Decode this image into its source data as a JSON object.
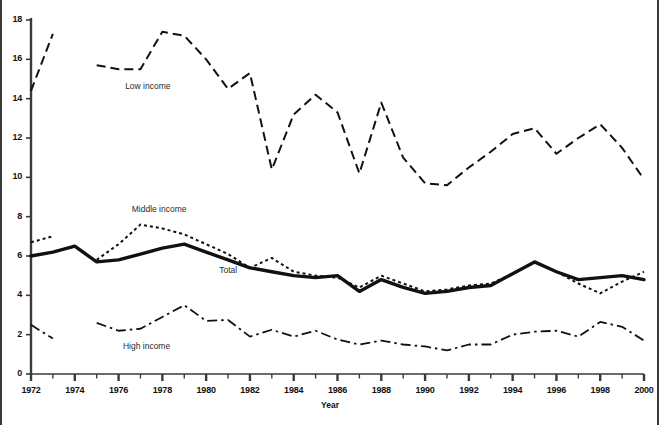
{
  "chart_data": {
    "type": "line",
    "title": "",
    "xlabel": "Year",
    "ylabel": "",
    "xlim": [
      1972,
      2000
    ],
    "ylim": [
      0,
      18
    ],
    "grid": false,
    "legend_position": "inline-annotations",
    "x": [
      1972,
      1973,
      1974,
      1975,
      1976,
      1977,
      1978,
      1979,
      1980,
      1981,
      1982,
      1983,
      1984,
      1985,
      1986,
      1987,
      1988,
      1989,
      1990,
      1991,
      1992,
      1993,
      1994,
      1995,
      1996,
      1997,
      1998,
      1999,
      2000
    ],
    "y_ticks": [
      0,
      2,
      4,
      6,
      8,
      10,
      12,
      14,
      16,
      18
    ],
    "y_tick_labels": [
      "0",
      "2",
      "4",
      "6",
      "8",
      "10",
      "12",
      "14",
      "16",
      "18"
    ],
    "x_ticks": [
      1972,
      1973,
      1974,
      1975,
      1976,
      1977,
      1978,
      1979,
      1980,
      1981,
      1982,
      1983,
      1984,
      1985,
      1986,
      1987,
      1988,
      1989,
      1990,
      1991,
      1992,
      1993,
      1994,
      1995,
      1996,
      1997,
      1998,
      1999,
      2000
    ],
    "x_tick_labels": [
      "1972",
      "1974",
      "1976",
      "1978",
      "1980",
      "1982",
      "1984",
      "1986",
      "1988",
      "1990",
      "1992",
      "1994",
      "1996",
      "1998",
      "2000"
    ],
    "x_labeled_ticks": [
      1972,
      1974,
      1976,
      1978,
      1980,
      1982,
      1984,
      1986,
      1988,
      1990,
      1992,
      1994,
      1996,
      1998,
      2000
    ],
    "series": [
      {
        "name": "Low income",
        "style": "dashed",
        "values": [
          14.4,
          17.3,
          null,
          15.7,
          15.5,
          15.5,
          17.4,
          17.2,
          16.0,
          14.5,
          15.3,
          10.4,
          13.2,
          14.2,
          13.3,
          10.2,
          13.8,
          11.0,
          9.7,
          9.6,
          10.5,
          11.3,
          12.2,
          12.5,
          11.2,
          12.0,
          12.7,
          11.5,
          9.9
        ]
      },
      {
        "name": "Middle income",
        "style": "dotted",
        "values": [
          6.7,
          7.0,
          null,
          5.8,
          6.6,
          7.6,
          7.4,
          7.1,
          6.6,
          6.1,
          5.4,
          5.9,
          5.2,
          5.0,
          4.9,
          4.4,
          5.0,
          4.6,
          4.2,
          4.3,
          4.5,
          4.6,
          5.1,
          5.7,
          5.2,
          4.6,
          4.1,
          4.7,
          5.2
        ]
      },
      {
        "name": "Total",
        "style": "solid-thick",
        "values": [
          6.0,
          6.2,
          6.5,
          5.7,
          5.8,
          6.1,
          6.4,
          6.6,
          6.2,
          5.8,
          5.4,
          5.2,
          5.0,
          4.9,
          5.0,
          4.2,
          4.8,
          4.4,
          4.1,
          4.2,
          4.4,
          4.5,
          5.1,
          5.7,
          5.2,
          4.8,
          4.9,
          5.0,
          4.8
        ]
      },
      {
        "name": "High income",
        "style": "dash-dot",
        "values": [
          2.5,
          1.8,
          null,
          2.6,
          2.2,
          2.3,
          2.9,
          3.5,
          2.7,
          2.75,
          1.9,
          2.25,
          1.9,
          2.2,
          1.75,
          1.5,
          1.7,
          1.5,
          1.4,
          1.2,
          1.5,
          1.5,
          2.0,
          2.15,
          2.2,
          1.9,
          2.65,
          2.4,
          1.7
        ]
      }
    ],
    "annotations": [
      {
        "text": "Low income",
        "x": 1976.3,
        "y": 14.6
      },
      {
        "text": "Middle income",
        "x": 1976.6,
        "y": 8.35
      },
      {
        "text": "Total",
        "x": 1980.6,
        "y": 5.25
      },
      {
        "text": "High income",
        "x": 1976.2,
        "y": 1.35
      }
    ],
    "colors": {
      "line": "#111111",
      "axis": "#3a3a3a",
      "background": "#ffffff",
      "annotation": "#2b2b2b",
      "frame": "#555555"
    }
  }
}
